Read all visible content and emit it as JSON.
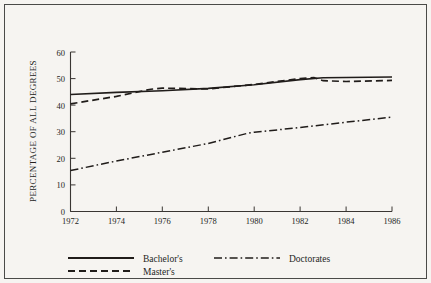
{
  "chart_data": {
    "type": "line",
    "title": "",
    "xlabel": "",
    "ylabel": "PERCENTAGE OF ALL DEGREES",
    "x": [
      1972,
      1974,
      1976,
      1978,
      1980,
      1982,
      1984,
      1986
    ],
    "xlim": [
      1972,
      1986
    ],
    "ylim": [
      0,
      60
    ],
    "yticks": [
      0,
      10,
      20,
      30,
      40,
      50,
      60
    ],
    "xticks": [
      1972,
      1974,
      1976,
      1978,
      1980,
      1982,
      1984,
      1986
    ],
    "grid": false,
    "legend_position": "bottom",
    "series": [
      {
        "name": "Bachelor's",
        "style": "solid",
        "x": [
          1972,
          1974,
          1976,
          1978,
          1980,
          1982,
          1983,
          1984,
          1986
        ],
        "values": [
          44.0,
          44.8,
          45.4,
          46.3,
          47.7,
          49.6,
          50.3,
          50.4,
          50.6
        ]
      },
      {
        "name": "Master's",
        "style": "dashed",
        "x": [
          1972,
          1974,
          1975.5,
          1976,
          1978,
          1980,
          1982,
          1982.6,
          1983,
          1984,
          1986
        ],
        "values": [
          40.5,
          43.3,
          46.0,
          46.4,
          46.1,
          47.8,
          50.0,
          50.4,
          49.2,
          48.9,
          49.3
        ]
      },
      {
        "name": "Doctorates",
        "style": "dash-dot",
        "x": [
          1972,
          1974,
          1976,
          1978,
          1979.7,
          1980,
          1982,
          1984,
          1986
        ],
        "values": [
          15.4,
          19.0,
          22.3,
          25.6,
          29.4,
          29.8,
          31.6,
          33.6,
          35.5
        ]
      }
    ],
    "ytick_labels": [
      "0",
      "10",
      "20",
      "30",
      "40",
      "50",
      "60"
    ],
    "xtick_labels": [
      "1972",
      "1974",
      "1976",
      "1978",
      "1980",
      "1982",
      "1984",
      "1986"
    ]
  },
  "legend": {
    "entries": [
      {
        "label": "Bachelor's",
        "style": "solid"
      },
      {
        "label": "Master's",
        "style": "dashed"
      },
      {
        "label": "Doctorates",
        "style": "dash-dot"
      }
    ]
  },
  "colors": {
    "ink": "#201c1a",
    "axis": "#3a3633",
    "background": "#f6f4f1",
    "frame": "#4a4a48"
  }
}
